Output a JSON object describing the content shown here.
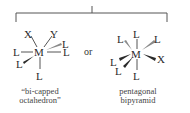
{
  "colors": {
    "ink": "#2a2a2a",
    "bond": "#555555",
    "bond_light": "#8a8a8a",
    "background": "#ffffff"
  },
  "connector": {
    "label": "or"
  },
  "structures": [
    {
      "id": "bicapped-octahedron",
      "caption_line1": "“bi-capped",
      "caption_line2": "octahedron”",
      "center": "M",
      "ligands": {
        "top_left": "X",
        "top_right": "Y",
        "upper_right": "L",
        "right": "L",
        "left": "L",
        "lower_left": "L",
        "bottom": "L"
      }
    },
    {
      "id": "pentagonal-bipyramid",
      "caption_line1": "pentagonal",
      "caption_line2": "bipyramid",
      "center": "M",
      "ligands": {
        "top": "L",
        "upper_left": "L",
        "upper_right": "L",
        "right": "X",
        "left": "L",
        "lower_left": "L",
        "bottom": "L"
      }
    }
  ]
}
